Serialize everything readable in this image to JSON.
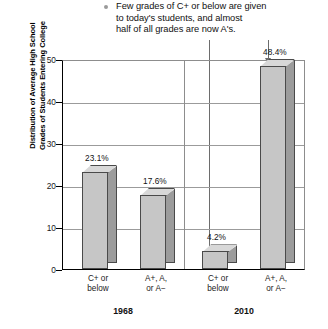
{
  "caption": {
    "bullet": "bullet-dot",
    "text": "Few grades of C+ or below are given\nto today's students, and almost\nhalf of all grades are now A's."
  },
  "annotations": {
    "left_leader_target": "4.2%",
    "right_leader_target": "48.4%"
  },
  "chart_data": {
    "type": "bar",
    "title": "",
    "xlabel": "",
    "ylabel": "Distribution of Average High School\nGrades of Students Entering College",
    "ylim": [
      0,
      50
    ],
    "yticks": [
      0,
      10,
      20,
      30,
      40,
      50
    ],
    "ytick_labels": [
      "0",
      "10",
      "20",
      "30",
      "40",
      "50"
    ],
    "grid": true,
    "legend": "none",
    "groups": [
      "1968",
      "2010"
    ],
    "categories": [
      "C+ or\nbelow",
      "A+, A,\nor A−",
      "C+ or\nbelow",
      "A+, A,\nor A−"
    ],
    "values": [
      23.1,
      17.6,
      4.2,
      48.4
    ],
    "value_labels": [
      "23.1%",
      "17.6%",
      "4.2%",
      "48.4%"
    ],
    "series": [
      {
        "name": "Distribution of Average High School Grades of Students Entering College",
        "values": [
          23.1,
          17.6,
          4.2,
          48.4
        ]
      }
    ]
  }
}
